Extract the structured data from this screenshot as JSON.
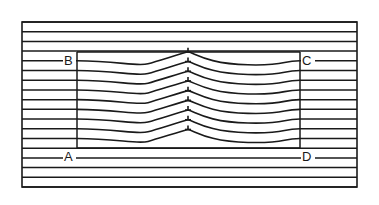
{
  "diagram": {
    "type": "crystal-lattice-edge-dislocation",
    "corner_labels": {
      "top_left": "B",
      "top_right": "C",
      "bottom_left": "A",
      "bottom_right": "D"
    },
    "colors": {
      "line": "#1a1a1a",
      "background": "#ffffff"
    },
    "outer_frame": {
      "left": 22,
      "right": 357,
      "top": 22,
      "bottom": 187
    },
    "inner_rect": {
      "left": 77,
      "right": 300,
      "top": 52,
      "bottom": 148
    },
    "horizontal_line_count": 18,
    "wavy_line_count": 8,
    "dislocation_marks": 8
  }
}
